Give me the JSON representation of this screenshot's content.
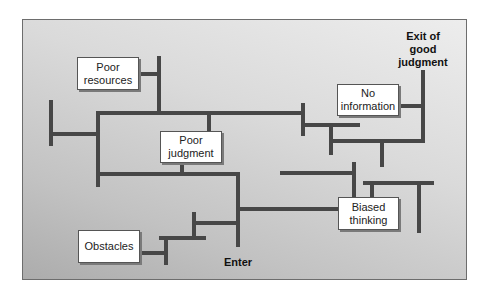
{
  "diagram": {
    "type": "maze",
    "exit_label": "Exit of good judgment",
    "exit_lines": [
      "Exit of",
      "good",
      "judgment"
    ],
    "enter_label": "Enter",
    "obstacles": [
      {
        "id": "poor-resources",
        "lines": [
          "Poor",
          "resources"
        ]
      },
      {
        "id": "no-information",
        "lines": [
          "No",
          "information"
        ]
      },
      {
        "id": "poor-judgment",
        "lines": [
          "Poor",
          "judgment"
        ]
      },
      {
        "id": "biased-thinking",
        "lines": [
          "Biased",
          "thinking"
        ]
      },
      {
        "id": "obstacles",
        "lines": [
          "Obstacles"
        ]
      }
    ],
    "colors": {
      "wall": "#474747",
      "panel_light": "#ededed",
      "panel_dark": "#acacac",
      "box_fill": "#ffffff"
    }
  }
}
